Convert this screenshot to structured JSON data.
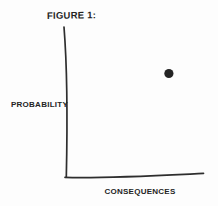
{
  "chart_data": {
    "type": "scatter",
    "title": "FIGURE 1:",
    "xlabel": "CONSEQUENCES",
    "ylabel": "PROBABILITY",
    "style": "hand-drawn sketch, no ticks, no grid, no numeric scale",
    "axes": {
      "x_range": [
        0,
        1
      ],
      "y_range": [
        0,
        1
      ],
      "tick_labels": "none",
      "grid": false
    },
    "series": [
      {
        "name": "single-risk-point",
        "points": [
          {
            "x": 0.75,
            "y": 0.69
          }
        ],
        "marker": "filled-dot",
        "marker_radius_px": 4.6
      }
    ],
    "legend": "none"
  },
  "colors": {
    "ink": "#242424",
    "axis": "#2e2e2e",
    "background": "#fdfdfd"
  }
}
